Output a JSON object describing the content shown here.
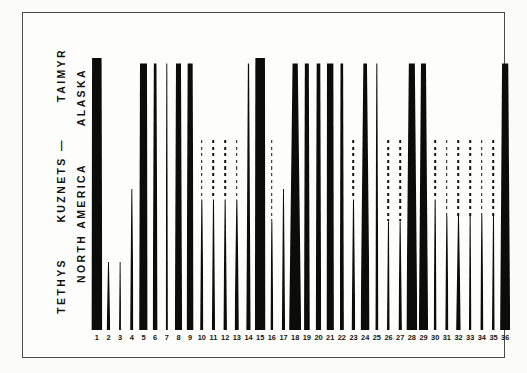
{
  "figure": {
    "background_color": "#fbfbf9",
    "frame_color": "#4a4a48",
    "ink_color": "#0c0c0b"
  },
  "left_labels": {
    "column_1": [
      {
        "text": "TETHYS"
      },
      {
        "text": "KUZNETS —"
      },
      {
        "text": "TAIMYR"
      }
    ],
    "column_2": [
      {
        "text": "NORTH AMERICA"
      },
      {
        "text": "ALASKA"
      }
    ]
  },
  "axis": {
    "tick_labels": [
      "1",
      "2",
      "3",
      "4",
      "5",
      "6",
      "7",
      "8",
      "9",
      "10",
      "11",
      "12",
      "13",
      "14",
      "15",
      "16",
      "17",
      "18",
      "19",
      "20",
      "21",
      "22",
      "23",
      "24",
      "25",
      "26",
      "27",
      "28",
      "29",
      "30",
      "31",
      "32",
      "33",
      "34",
      "35",
      "36"
    ]
  },
  "chart_data": {
    "type": "bar",
    "title": "",
    "subtitle": "",
    "xlabel": "",
    "ylabel": "",
    "grid": false,
    "legend": null,
    "categories": [
      "1",
      "2",
      "3",
      "4",
      "5",
      "6",
      "7",
      "8",
      "9",
      "10",
      "11",
      "12",
      "13",
      "14",
      "15",
      "16",
      "17",
      "18",
      "19",
      "20",
      "21",
      "22",
      "23",
      "24",
      "25",
      "26",
      "27",
      "28",
      "29",
      "30",
      "31",
      "32",
      "33",
      "34",
      "35",
      "36"
    ],
    "series": [
      {
        "name": "solid_range_top_percent",
        "values": [
          100,
          25,
          25,
          52,
          98,
          98,
          98,
          98,
          98,
          48,
          48,
          48,
          48,
          98,
          100,
          40,
          52,
          98,
          98,
          98,
          98,
          98,
          48,
          98,
          98,
          40,
          40,
          98,
          98,
          48,
          42,
          42,
          42,
          42,
          42,
          98
        ]
      },
      {
        "name": "dashed_range_top_percent",
        "values": [
          0,
          0,
          0,
          0,
          0,
          0,
          0,
          0,
          0,
          70,
          70,
          70,
          70,
          0,
          0,
          70,
          0,
          0,
          0,
          0,
          0,
          0,
          70,
          0,
          98,
          70,
          70,
          0,
          0,
          70,
          70,
          70,
          70,
          70,
          70,
          0
        ]
      },
      {
        "name": "base_width_px",
        "values": [
          11,
          3.5,
          2.2,
          3.6,
          8.5,
          5.0,
          2.4,
          7.2,
          7.2,
          3.6,
          3.2,
          3.6,
          4.6,
          4.2,
          10.5,
          3.0,
          3.2,
          12.0,
          5.8,
          5.4,
          7.4,
          4.0,
          3.6,
          9.2,
          3.2,
          3.0,
          3.4,
          11.0,
          9.2,
          3.0,
          3.4,
          4.6,
          2.4,
          3.2,
          3.0,
          10.0
        ]
      },
      {
        "name": "top_width_px",
        "values": [
          9.5,
          0.9,
          0.9,
          0.9,
          7.0,
          2.6,
          1.0,
          5.0,
          5.0,
          1.0,
          1.0,
          1.0,
          1.0,
          1.2,
          9.6,
          1.0,
          0.9,
          5.2,
          4.0,
          3.6,
          6.4,
          2.6,
          1.0,
          3.6,
          1.0,
          1.0,
          1.0,
          6.0,
          5.0,
          1.0,
          1.0,
          1.0,
          1.0,
          1.0,
          1.0,
          6.2
        ]
      }
    ],
    "ylim": [
      0,
      100
    ],
    "y_axis_visible": false
  }
}
